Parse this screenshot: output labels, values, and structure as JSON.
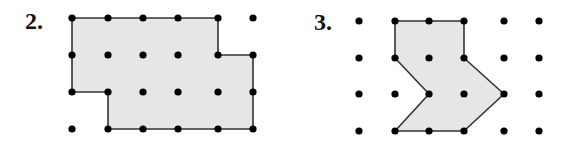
{
  "figures": [
    {
      "label": "2.",
      "label_pos": [
        25,
        9
      ],
      "grid_x": [
        72,
        108,
        143,
        178,
        218,
        253
      ],
      "grid_y": [
        18,
        55,
        92,
        129
      ],
      "polygon": [
        [
          0,
          0
        ],
        [
          4,
          0
        ],
        [
          4,
          1
        ],
        [
          5,
          1
        ],
        [
          5,
          3
        ],
        [
          1,
          3
        ],
        [
          1,
          2
        ],
        [
          0,
          2
        ]
      ],
      "fill": "#e6e6e6",
      "stroke": "#333333"
    },
    {
      "label": "3.",
      "label_pos": [
        314,
        10
      ],
      "grid_x": [
        359,
        395,
        429,
        464,
        504,
        539
      ],
      "grid_y": [
        21,
        58,
        94,
        131
      ],
      "polygon": [
        [
          1,
          0
        ],
        [
          3,
          0
        ],
        [
          3,
          1
        ],
        [
          4,
          2
        ],
        [
          3,
          3
        ],
        [
          1,
          3
        ],
        [
          2,
          2
        ],
        [
          1,
          1
        ]
      ],
      "fill": "#e6e6e6",
      "stroke": "#333333"
    }
  ],
  "dot_color": "#000000",
  "dot_radius": 3.6
}
